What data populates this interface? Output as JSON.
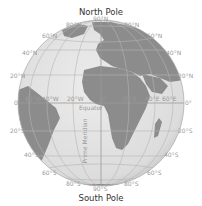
{
  "titles": {
    "north": "North Pole",
    "south": "South Pole"
  },
  "labels": {
    "lat_top_center": "90°N",
    "lat_80n_left": "80°N",
    "lat_80n_right": "80°N",
    "lat_60n_left": "60°N",
    "lat_60n_right": "60°N",
    "lat_40n_left": "40°N",
    "lat_40n_right": "40°N",
    "lat_20n_left": "20°N",
    "lat_20n_right": "20°N",
    "eq_left": "0°",
    "eq_right": "0°",
    "lat_20s_left": "20°S",
    "lat_20s_right": "20°S",
    "lat_40s_left": "40°S",
    "lat_40s_right": "40°S",
    "lat_60s_left": "60°S",
    "lat_60s_right": "60°S",
    "lat_80s_left": "80°S",
    "lat_80s_right": "80°S",
    "lat_bottom_center": "90°S",
    "lon_60w": "60°W",
    "lon_40w": "40°W",
    "lon_20w": "20°W",
    "lon_0": "0°",
    "lon_20e": "20°E",
    "lon_40e": "40°E",
    "lon_60e": "60°E",
    "equator": "Equator",
    "prime_meridian": "Prime Meridian"
  },
  "colors": {
    "ocean": "#e2e2e2",
    "land": "#8c8c8c",
    "grid": "#b5b5b5",
    "label": "#9a9a9a",
    "title": "#333333"
  }
}
